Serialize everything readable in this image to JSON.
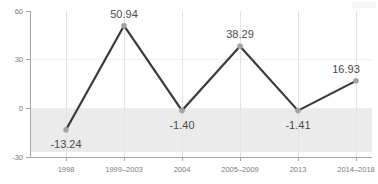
{
  "chart_data": {
    "type": "line",
    "title": "",
    "xlabel": "",
    "ylabel": "",
    "categories": [
      "1998",
      "1999–2003",
      "2004",
      "2005–2009",
      "2013",
      "2014–2018"
    ],
    "values": [
      -13.24,
      50.94,
      -1.4,
      38.29,
      -1.41,
      16.93
    ],
    "data_labels": [
      "-13.24",
      "50.94",
      "-1.40",
      "38.29",
      "-1.41",
      "16.93"
    ],
    "ylim": [
      -30,
      60
    ],
    "yticks": [
      60,
      30,
      0,
      -30
    ],
    "ytick_labels": [
      "60",
      "30",
      "0",
      "-30"
    ],
    "grid": true,
    "legend": "none",
    "series": [
      {
        "name": "",
        "values": [
          -13.24,
          50.94,
          -1.4,
          38.29,
          -1.41,
          16.93
        ]
      }
    ],
    "annotations": {
      "negative_band": "shaded gray region below zero"
    },
    "colors": {
      "line": "#3a3a3a",
      "marker": "#a3a3a3",
      "negative_band": "#ebebeb",
      "axis": "#a6a6a6",
      "tick_text": "#7b7b7b",
      "value_text": "#4a4a4a",
      "gridline_h": "#f0f0f0",
      "gridline_v": "#e3e3e3",
      "background": "#ffffff"
    }
  }
}
